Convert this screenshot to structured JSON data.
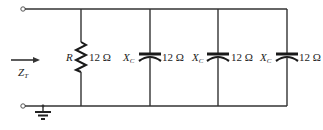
{
  "diagram": {
    "type": "parallel RC circuit",
    "input": {
      "label": "Z",
      "subscript": "T",
      "arrow_direction": "right"
    },
    "branches": [
      {
        "component": "resistor",
        "symbol": "R",
        "symbol_subscript": "",
        "value": "12 Ω"
      },
      {
        "component": "capacitor",
        "symbol": "X",
        "symbol_subscript": "C",
        "value": "12 Ω"
      },
      {
        "component": "capacitor",
        "symbol": "X",
        "symbol_subscript": "C",
        "value": "12 Ω"
      },
      {
        "component": "capacitor",
        "symbol": "X",
        "symbol_subscript": "C",
        "value": "12 Ω"
      }
    ],
    "terminals": [
      "top-terminal",
      "bottom-terminal"
    ],
    "ground": "bottom rail",
    "colors": {
      "wire": "#333333",
      "component": "#1a1a1a",
      "text": "#222222",
      "background": "#ffffff"
    }
  }
}
